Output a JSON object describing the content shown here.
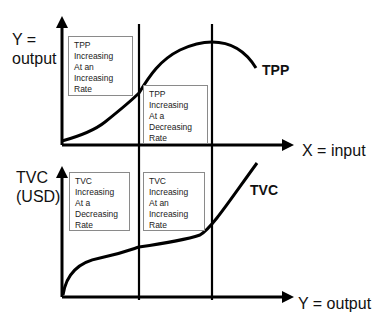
{
  "top_graph": {
    "y_axis_label_line1": "Y =",
    "y_axis_label_line2": "output",
    "x_axis_label": "X = input",
    "curve_label": "TPP",
    "region_boxes": [
      {
        "lines": [
          "TPP",
          "Increasing",
          "At an",
          "Increasing",
          "Rate"
        ]
      },
      {
        "lines": [
          "TPP",
          "Increasing",
          "At a",
          "Decreasing",
          "Rate"
        ]
      }
    ]
  },
  "bottom_graph": {
    "y_axis_label_line1": "TVC",
    "y_axis_label_line2": "(USD)",
    "x_axis_label": "Y = output",
    "curve_label": "TVC",
    "region_boxes": [
      {
        "lines": [
          "TVC",
          "Increasing",
          "At a",
          "Decreasing",
          "Rate"
        ]
      },
      {
        "lines": [
          "TVC",
          "Increasing",
          "At an",
          "Increasing",
          "Rate"
        ]
      }
    ]
  },
  "colors": {
    "line": "#000000",
    "box_border": "#8a8a8a"
  }
}
